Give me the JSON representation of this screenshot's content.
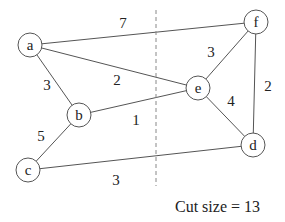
{
  "diagram": {
    "caption": "Cut size = 13",
    "cut_line": {
      "x": 156,
      "y1": 10,
      "y2": 186
    },
    "nodes": [
      {
        "id": "a",
        "label": "a",
        "x": 30,
        "y": 45
      },
      {
        "id": "b",
        "label": "b",
        "x": 79,
        "y": 115
      },
      {
        "id": "c",
        "label": "c",
        "x": 28,
        "y": 170
      },
      {
        "id": "d",
        "label": "d",
        "x": 253,
        "y": 145
      },
      {
        "id": "e",
        "label": "e",
        "x": 198,
        "y": 88
      },
      {
        "id": "f",
        "label": "f",
        "x": 256,
        "y": 22
      }
    ],
    "edges": [
      {
        "from": "a",
        "to": "f",
        "weight": "7",
        "lx": 123,
        "ly": 23
      },
      {
        "from": "a",
        "to": "e",
        "weight": "2",
        "lx": 117,
        "ly": 80
      },
      {
        "from": "a",
        "to": "b",
        "weight": "3",
        "lx": 47,
        "ly": 85
      },
      {
        "from": "b",
        "to": "e",
        "weight": "1",
        "lx": 136,
        "ly": 120
      },
      {
        "from": "b",
        "to": "c",
        "weight": "5",
        "lx": 41,
        "ly": 136
      },
      {
        "from": "c",
        "to": "d",
        "weight": "3",
        "lx": 116,
        "ly": 180
      },
      {
        "from": "e",
        "to": "f",
        "weight": "3",
        "lx": 211,
        "ly": 52
      },
      {
        "from": "e",
        "to": "d",
        "weight": "4",
        "lx": 231,
        "ly": 101
      },
      {
        "from": "f",
        "to": "d",
        "weight": "2",
        "lx": 268,
        "ly": 86
      }
    ]
  }
}
